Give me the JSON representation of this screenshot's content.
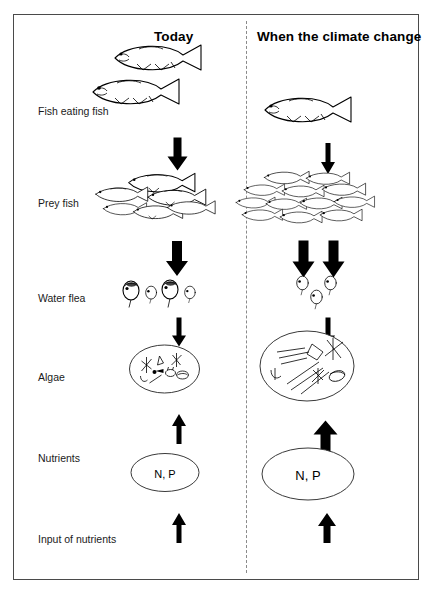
{
  "diagram": {
    "columns": [
      {
        "id": "today",
        "label": "Today"
      },
      {
        "id": "climate",
        "label": "When the climate change"
      }
    ],
    "rows": [
      {
        "id": "fish-eating-fish",
        "label": "Fish eating fish"
      },
      {
        "id": "prey-fish",
        "label": "Prey fish"
      },
      {
        "id": "water-flea",
        "label": "Water flea"
      },
      {
        "id": "algae",
        "label": "Algae"
      },
      {
        "id": "nutrients",
        "label": "Nutrients"
      },
      {
        "id": "input-nutrients",
        "label": "Input of nutrients"
      }
    ],
    "nutrient_label": "N, P",
    "counts": {
      "today": {
        "fish_eating_fish": 2,
        "prey_fish": 6,
        "water_flea": 4,
        "algae_cells": 8,
        "arrows_prey_to_flea": 1
      },
      "climate": {
        "fish_eating_fish": 1,
        "prey_fish": 12,
        "water_flea": 3,
        "algae_cells": 12,
        "arrows_prey_to_flea": 2
      }
    },
    "arrows": {
      "today": {
        "predator_to_prey": "down-thick",
        "prey_to_flea": "down-thick",
        "flea_to_algae": "down-thin",
        "nutrients_to_algae": "up-thin",
        "input_to_nutrients": "up-thin"
      },
      "climate": {
        "predator_to_prey": "down-thin",
        "prey_to_flea": "down-thick-double",
        "flea_to_algae": "down-thin",
        "nutrients_to_algae": "up-thick",
        "input_to_nutrients": "up-medium"
      }
    },
    "colors": {
      "frame_border": "#4a4a4a",
      "divider": "#8a8a8a",
      "ink": "#000000",
      "background": "#ffffff"
    }
  }
}
